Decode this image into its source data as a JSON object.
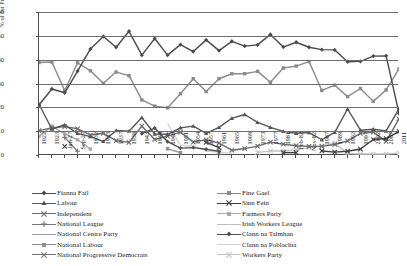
{
  "chart_data": {
    "type": "line",
    "title": "",
    "xlabel": "",
    "ylabel": "% of 1st Preference Votes",
    "ylim": [
      0,
      60
    ],
    "yticks": [
      0,
      10,
      20,
      30,
      40,
      50,
      60
    ],
    "grid": true,
    "legend_position": "bottom",
    "categories": [
      "1922",
      "1923",
      "Jun-27",
      "Sep-27",
      "1932",
      "1933",
      "1937",
      "1938",
      "1943",
      "1944",
      "1948",
      "1951",
      "1954",
      "1957",
      "1961",
      "1965",
      "1969",
      "1973",
      "1977",
      "1981",
      "Feb-82",
      "Nov-82",
      "1987",
      "1989",
      "1992",
      "1997",
      "2002",
      "2007",
      "2011"
    ],
    "series": [
      {
        "name": "Fianna Fail",
        "color": "#4a4a4a",
        "marker": "diamond",
        "values": [
          21.0,
          27.7,
          26.1,
          35.2,
          44.5,
          49.7,
          45.2,
          51.9,
          41.9,
          48.9,
          41.9,
          46.3,
          43.4,
          48.3,
          43.8,
          47.7,
          45.7,
          46.2,
          50.6,
          45.3,
          47.3,
          45.2,
          44.2,
          44.1,
          39.1,
          39.3,
          41.5,
          41.6,
          17.4
        ]
      },
      {
        "name": "Fine Gael",
        "color": "#8a8a8a",
        "marker": "square",
        "values": [
          38.8,
          39.0,
          27.0,
          38.7,
          35.3,
          30.1,
          34.8,
          33.3,
          23.1,
          20.5,
          19.8,
          25.7,
          32.0,
          26.6,
          32.0,
          34.1,
          34.1,
          35.1,
          30.5,
          36.5,
          37.3,
          39.2,
          27.1,
          29.3,
          24.5,
          27.9,
          22.5,
          27.3,
          36.1
        ]
      },
      {
        "name": "Labour",
        "color": "#555555",
        "marker": "triangle",
        "values": [
          21.3,
          10.9,
          12.6,
          9.1,
          7.7,
          5.7,
          10.3,
          10.0,
          15.7,
          8.8,
          8.7,
          11.4,
          12.1,
          9.1,
          11.6,
          15.4,
          17.0,
          13.7,
          11.6,
          9.9,
          9.1,
          9.4,
          6.4,
          9.5,
          19.3,
          10.4,
          10.8,
          10.1,
          19.4
        ]
      },
      {
        "name": "Sinn Fein",
        "color": "#3d3d3d",
        "marker": "x",
        "values": [
          0,
          0,
          3.6,
          0,
          0,
          0,
          0,
          0,
          0,
          0,
          0,
          0,
          0,
          5.3,
          3.1,
          0,
          0,
          0,
          0,
          1.0,
          1.0,
          0,
          1.7,
          1.2,
          1.6,
          2.5,
          6.5,
          6.9,
          9.9
        ]
      },
      {
        "name": "Independent",
        "color": "#6b6b6b",
        "marker": "x",
        "values": [
          10.2,
          11.4,
          11.9,
          11.0,
          8.4,
          9.1,
          6.0,
          5.3,
          12.1,
          6.5,
          7.9,
          9.6,
          5.4,
          6.4,
          5.0,
          2.0,
          2.7,
          3.7,
          5.4,
          4.5,
          3.9,
          3.6,
          3.6,
          4.4,
          5.9,
          9.1,
          9.6,
          5.7,
          15.2
        ]
      },
      {
        "name": "Farmers Party",
        "color": "#a8a8a8",
        "marker": "square",
        "values": [
          7.8,
          12.1,
          8.9,
          6.4,
          2.5,
          0,
          0,
          0,
          0,
          0,
          0,
          0,
          0,
          0,
          0,
          0,
          0,
          0,
          0,
          0,
          0,
          0,
          0,
          0,
          0,
          0,
          0,
          0,
          0
        ]
      },
      {
        "name": "National League",
        "color": "#777777",
        "marker": "plus",
        "values": [
          0,
          0,
          7.4,
          1.6,
          0,
          0,
          0,
          0,
          0,
          0,
          0,
          0,
          0,
          0,
          0,
          0,
          0,
          0,
          0,
          0,
          0,
          0,
          0,
          0,
          0,
          0,
          0,
          0,
          0
        ]
      },
      {
        "name": "Irish Workers League",
        "color": "#bdbdbd",
        "marker": "none",
        "values": [
          0,
          0,
          0,
          0,
          0,
          0,
          0,
          0,
          0,
          0,
          0,
          0,
          0,
          0,
          0,
          0,
          0,
          0,
          0,
          0,
          0,
          0,
          0,
          0,
          0,
          0,
          0,
          0,
          0
        ]
      },
      {
        "name": "National Centre Party",
        "color": "#9c9c9c",
        "marker": "none",
        "values": [
          0,
          0,
          0,
          0,
          0,
          9.2,
          0,
          0,
          0,
          0,
          0,
          0,
          0,
          0,
          0,
          0,
          0,
          0,
          0,
          0,
          0,
          0,
          0,
          0,
          0,
          0,
          0,
          0,
          0
        ]
      },
      {
        "name": "Clann na Talmhan",
        "color": "#4f4f4f",
        "marker": "diamond",
        "values": [
          0,
          0,
          0,
          0,
          0,
          0,
          0,
          0,
          9.0,
          11.3,
          5.6,
          2.9,
          3.1,
          2.4,
          1.5,
          0,
          0,
          0,
          0,
          0,
          0,
          0,
          0,
          0,
          0,
          0,
          0,
          0,
          0
        ]
      },
      {
        "name": "National Labour",
        "color": "#8f8f8f",
        "marker": "square",
        "values": [
          0,
          0,
          0,
          0,
          0,
          0,
          0,
          0,
          0,
          0,
          2.6,
          1.0,
          0,
          0,
          0,
          0,
          0,
          0,
          0,
          0,
          0,
          0,
          0,
          0,
          0,
          0,
          0,
          0,
          0
        ]
      },
      {
        "name": "Clann na Poblachta",
        "color": "#d2d2d2",
        "marker": "none",
        "values": [
          0,
          0,
          0,
          0,
          0,
          0,
          0,
          0,
          0,
          0,
          13.2,
          4.1,
          3.8,
          1.7,
          1.1,
          0.8,
          0,
          0,
          0,
          0,
          0,
          0,
          0,
          0,
          0,
          0,
          0,
          0,
          0
        ]
      },
      {
        "name": "National Progressive Democrats",
        "color": "#6f6f6f",
        "marker": "x",
        "values": [
          0,
          0,
          0,
          0,
          0,
          0,
          0,
          0,
          0,
          0,
          0,
          0,
          0,
          0,
          1.0,
          0,
          0,
          0,
          0,
          0,
          0,
          0,
          0,
          0,
          0,
          0,
          0,
          0,
          0
        ]
      },
      {
        "name": "Workers Party",
        "color": "#c4c4c4",
        "marker": "x",
        "values": [
          0,
          0,
          0,
          0,
          0,
          0,
          0,
          0,
          0,
          0,
          0,
          0,
          0,
          0,
          0,
          0,
          0,
          1.1,
          1.7,
          1.7,
          2.2,
          3.1,
          3.8,
          5.0,
          0.7,
          0.4,
          0.4,
          0.4,
          0.8
        ]
      }
    ]
  },
  "legend": {
    "left_items": [
      {
        "label": "Fianna Fail"
      },
      {
        "label": "Labour"
      },
      {
        "label": "Independent"
      },
      {
        "label": "National League"
      },
      {
        "label": "National Centre Party"
      },
      {
        "label": "National Labour"
      },
      {
        "label": "National Progressive Democrats"
      }
    ],
    "right_items": [
      {
        "label": "Fine Gael"
      },
      {
        "label": "Sinn Fein"
      },
      {
        "label": "Farmers Party"
      },
      {
        "label": "Irish Workers League"
      },
      {
        "label": "Clann na Talmhan"
      },
      {
        "label": "Clann na Poblachta"
      },
      {
        "label": "Workers Party"
      }
    ]
  }
}
